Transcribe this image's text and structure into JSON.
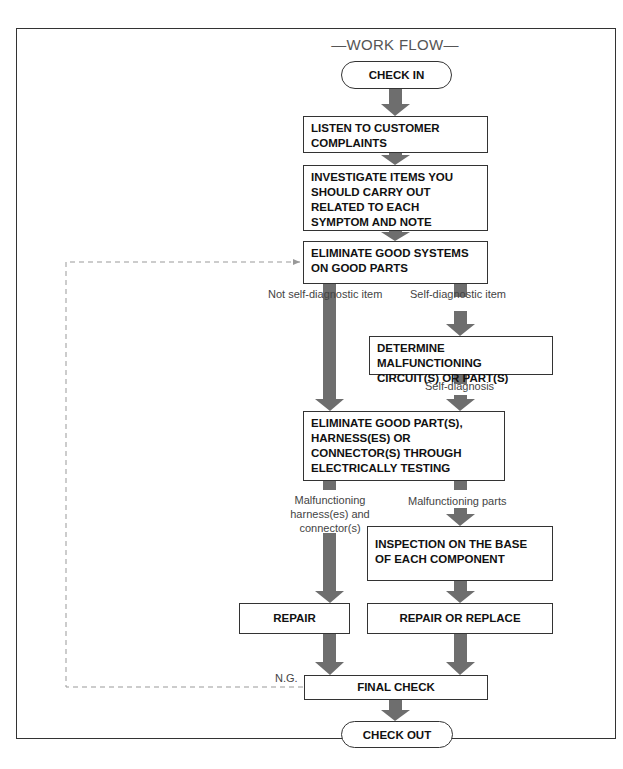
{
  "diagram": {
    "title": "—WORK FLOW—",
    "nodes": {
      "check_in": "CHECK IN",
      "listen": "LISTEN TO CUSTOMER COMPLAINTS",
      "investigate": "INVESTIGATE ITEMS YOU SHOULD CARRY OUT RELATED TO EACH SYMPTOM AND NOTE",
      "eliminate_systems": "ELIMINATE GOOD SYSTEMS ON GOOD PARTS",
      "determine": "DETERMINE MALFUNCTIONING CIRCUIT(S) OR PART(S)",
      "eliminate_parts": "ELIMINATE GOOD PART(S), HARNESS(ES) OR CONNECTOR(S) THROUGH ELECTRICALLY TESTING",
      "inspection": "INSPECTION ON THE BASE OF EACH COMPONENT",
      "repair": "REPAIR",
      "repair_replace": "REPAIR OR REPLACE",
      "final_check": "FINAL CHECK",
      "check_out": "CHECK OUT"
    },
    "edge_labels": {
      "not_self_diag": "Not self-diagnostic item",
      "self_diag_item": "Self-diagnostic item",
      "self_diagnosis": "Self-diagnosis",
      "malf_harness_1": "Malfunctioning",
      "malf_harness_2": "harness(es) and",
      "malf_harness_3": "connector(s)",
      "malf_parts": "Malfunctioning parts",
      "ng": "N.G."
    },
    "colors": {
      "arrow": "#6e6e6e",
      "border": "#333333",
      "dashed": "#999999"
    }
  }
}
